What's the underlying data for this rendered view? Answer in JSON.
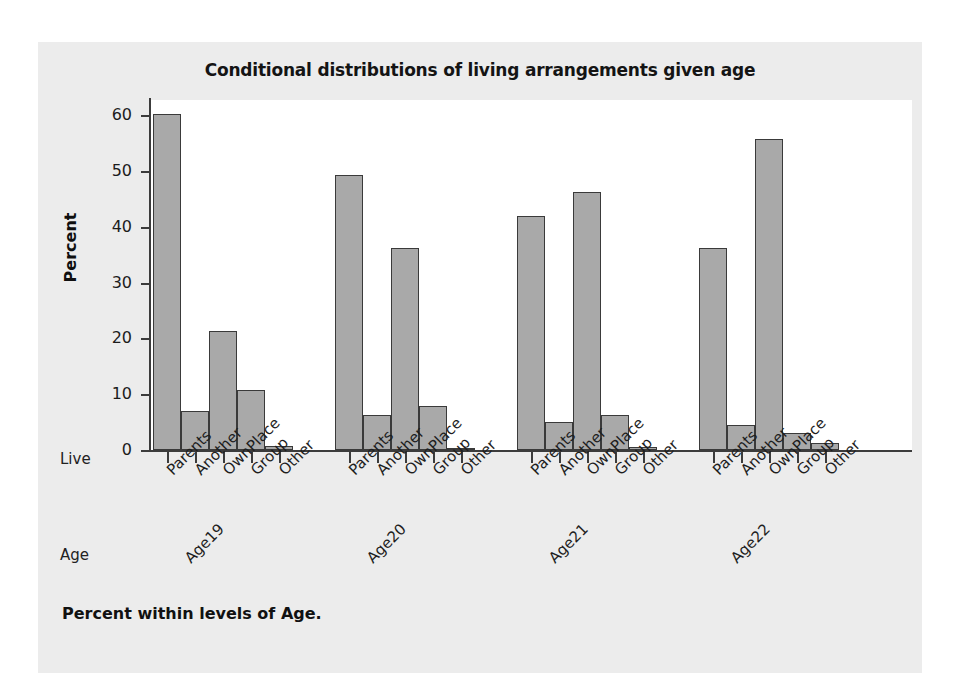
{
  "chart_data": {
    "type": "bar",
    "title": "Conditional distributions of living arrangements given age",
    "xlabel": "",
    "ylabel": "Percent",
    "ylim": [
      0,
      60
    ],
    "yticks": [
      0,
      10,
      20,
      30,
      40,
      50,
      60
    ],
    "grid": false,
    "legend": "none",
    "row_labels": {
      "category_row": "Live",
      "group_row": "Age"
    },
    "categories": [
      "Parents",
      "Another",
      "OwnPlace",
      "Group",
      "Other"
    ],
    "groups": [
      "Age19",
      "Age20",
      "Age21",
      "Age22"
    ],
    "series": [
      {
        "name": "Age19",
        "values": [
          60.1,
          6.9,
          21.4,
          10.8,
          0.8
        ]
      },
      {
        "name": "Age20",
        "values": [
          49.3,
          6.2,
          36.2,
          7.9,
          0.4
        ]
      },
      {
        "name": "Age21",
        "values": [
          42.0,
          5.1,
          46.2,
          6.2,
          0.6
        ]
      },
      {
        "name": "Age22",
        "values": [
          36.2,
          4.5,
          55.7,
          3.1,
          1.2
        ]
      }
    ],
    "footnote": "Percent within levels of Age.",
    "colors": {
      "bar_fill": "#a9a9a9",
      "bar_edge": "#3a3a3a",
      "panel_background": "#ececec",
      "plot_background": "#ffffff",
      "axis": "#3c3c3c",
      "text": "#1c1c1c"
    }
  }
}
